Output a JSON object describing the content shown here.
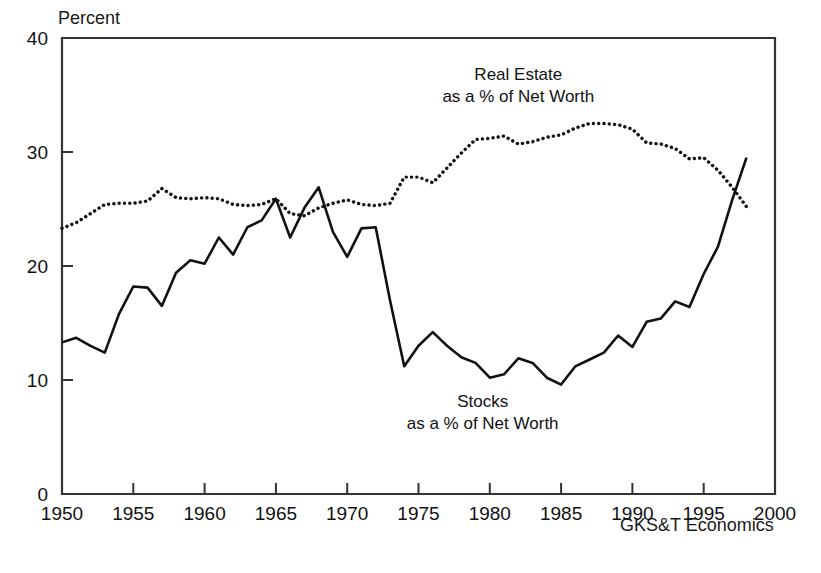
{
  "chart_data": {
    "type": "line",
    "title": "",
    "subtitle": "",
    "xlabel": "",
    "ylabel": "Percent",
    "xlim": [
      1950,
      2000
    ],
    "ylim": [
      0,
      40
    ],
    "xticks": [
      1950,
      1955,
      1960,
      1965,
      1970,
      1975,
      1980,
      1985,
      1990,
      1995,
      2000
    ],
    "yticks": [
      0,
      10,
      20,
      30,
      40
    ],
    "xtick_labels": [
      "1950",
      "1955",
      "1960",
      "1965",
      "1970",
      "1975",
      "1980",
      "1985",
      "1990",
      "1995",
      "2000"
    ],
    "ytick_labels": [
      "0",
      "10",
      "20",
      "30",
      "40"
    ],
    "grid": false,
    "legend_position": "inline-annotation",
    "source": "GKS&T Economics",
    "series": [
      {
        "name": "Real Estate as a % of Net Worth",
        "style": "dotted",
        "color": "#111111",
        "x": [
          1950,
          1951,
          1952,
          1953,
          1954,
          1955,
          1956,
          1957,
          1958,
          1959,
          1960,
          1961,
          1962,
          1963,
          1964,
          1965,
          1966,
          1967,
          1968,
          1969,
          1970,
          1971,
          1972,
          1973,
          1974,
          1975,
          1976,
          1977,
          1978,
          1979,
          1980,
          1981,
          1982,
          1983,
          1984,
          1985,
          1986,
          1987,
          1988,
          1989,
          1990,
          1991,
          1992,
          1993,
          1994,
          1995,
          1996,
          1997,
          1998
        ],
        "values": [
          23.3,
          23.8,
          24.6,
          25.4,
          25.5,
          25.5,
          25.7,
          26.8,
          26.0,
          25.9,
          26.0,
          25.9,
          25.4,
          25.3,
          25.4,
          25.9,
          24.6,
          24.4,
          25.1,
          25.5,
          25.8,
          25.4,
          25.3,
          25.5,
          27.8,
          27.8,
          27.3,
          28.6,
          29.9,
          31.1,
          31.2,
          31.4,
          30.7,
          30.9,
          31.3,
          31.5,
          32.1,
          32.5,
          32.5,
          32.4,
          32.0,
          30.8,
          30.7,
          30.3,
          29.4,
          29.5,
          28.4,
          26.9,
          25.2
        ]
      },
      {
        "name": "Stocks as a % of Net Worth",
        "style": "solid",
        "color": "#111111",
        "x": [
          1950,
          1951,
          1952,
          1953,
          1954,
          1955,
          1956,
          1957,
          1958,
          1959,
          1960,
          1961,
          1962,
          1963,
          1964,
          1965,
          1966,
          1967,
          1968,
          1969,
          1970,
          1971,
          1972,
          1973,
          1974,
          1975,
          1976,
          1977,
          1978,
          1979,
          1980,
          1981,
          1982,
          1983,
          1984,
          1985,
          1986,
          1987,
          1988,
          1989,
          1990,
          1991,
          1992,
          1993,
          1994,
          1995,
          1996,
          1997,
          1998
        ],
        "values": [
          13.3,
          13.7,
          13.0,
          12.4,
          15.8,
          18.2,
          18.1,
          16.5,
          19.4,
          20.5,
          20.2,
          22.5,
          21.0,
          23.4,
          24.0,
          25.9,
          22.5,
          25.1,
          26.9,
          23.0,
          20.8,
          23.3,
          23.4,
          17.0,
          11.2,
          13.0,
          14.2,
          13.0,
          12.0,
          11.5,
          10.2,
          10.5,
          11.9,
          11.5,
          10.2,
          9.6,
          11.2,
          11.8,
          12.4,
          13.9,
          12.9,
          15.1,
          15.4,
          16.9,
          16.4,
          19.3,
          21.7,
          25.8,
          29.5
        ]
      }
    ],
    "annotations": [
      {
        "id": "real-estate-label",
        "line1": "Real Estate",
        "line2": "as a % of Net Worth",
        "x": 1982,
        "y": 36.3
      },
      {
        "id": "stocks-label",
        "line1": "Stocks",
        "line2": "as a % of Net Worth",
        "x": 1979.5,
        "y": 7.6
      }
    ]
  },
  "figure": {
    "unit_label": "Percent",
    "source_label": "GKS&T Economics",
    "background": "#ffffff",
    "axis_color": "#333333",
    "line_color": "#111111"
  }
}
